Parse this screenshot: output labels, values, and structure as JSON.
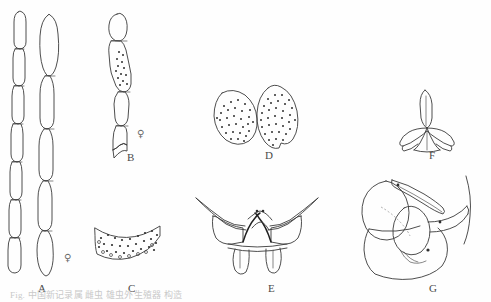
{
  "figure": {
    "type": "scientific-line-drawing-plate",
    "panel_count": 7,
    "caption_clipped": "Fig.        中国新记录属                                                雌虫 雄虫外生殖器 构造",
    "background_color": "#fefefe",
    "ink_color": "#3a3a3a"
  },
  "panels": [
    {
      "id": "A",
      "label": "A",
      "label_x": 38,
      "label_y": 289,
      "subject": "paired antennae, multi-segmented",
      "sex": "female",
      "sex_symbol": "♀",
      "sex_x": 64,
      "sex_y": 259
    },
    {
      "id": "B",
      "label": "B",
      "label_x": 127,
      "label_y": 158,
      "subject": "antenna apical segments with sensilla dots",
      "sex": "female",
      "sex_symbol": "♀",
      "sex_x": 137,
      "sex_y": 135
    },
    {
      "id": "C",
      "label": "C",
      "label_x": 128,
      "label_y": 289,
      "subject": "crescent sclerite with scattered punctures",
      "sex": "",
      "sex_symbol": "",
      "sex_x": 0,
      "sex_y": 0
    },
    {
      "id": "D",
      "label": "D",
      "label_x": 265,
      "label_y": 156,
      "subject": "paired ovate stippled plates",
      "sex": "",
      "sex_symbol": "",
      "sex_x": 0,
      "sex_y": 0
    },
    {
      "id": "E",
      "label": "E",
      "label_x": 268,
      "label_y": 289,
      "subject": "bilaterally symmetric genital segment, ventral view",
      "sex": "",
      "sex_symbol": "",
      "sex_x": 0,
      "sex_y": 0
    },
    {
      "id": "F",
      "label": "F",
      "label_x": 429,
      "label_y": 156,
      "subject": "tripod-shaped aedeagal apodeme",
      "sex": "",
      "sex_symbol": "",
      "sex_x": 0,
      "sex_y": 0
    },
    {
      "id": "G",
      "label": "G",
      "label_x": 429,
      "label_y": 289,
      "subject": "male genitalia, lateral view",
      "sex": "",
      "sex_symbol": "",
      "sex_x": 0,
      "sex_y": 0
    }
  ]
}
